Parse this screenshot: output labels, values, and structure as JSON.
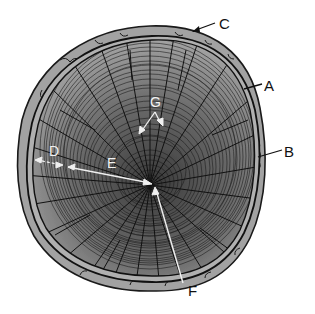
{
  "diagram": {
    "labels": {
      "A": "A",
      "B": "B",
      "C": "C",
      "D": "D",
      "E": "E",
      "F": "F",
      "G": "G"
    },
    "colors": {
      "background": "#ffffff",
      "bark": "#9a9a9a",
      "bark_outline": "#1a1a1a",
      "wood_light": "#b8b8b8",
      "wood_dark": "#4a4a4a",
      "ring_line": "#222222",
      "pointer_white": "#f0f0f0",
      "pointer_black": "#111111"
    }
  }
}
